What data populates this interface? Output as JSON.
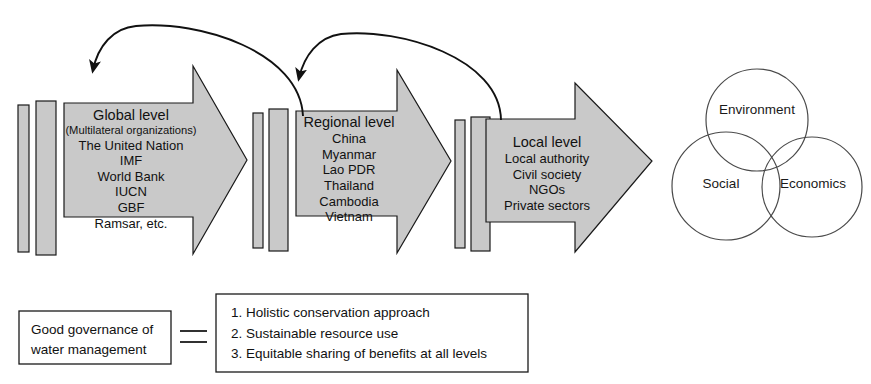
{
  "figure": {
    "type": "diagram"
  },
  "levels": [
    {
      "id": "global",
      "title": "Global level",
      "subtitle": "(Multilateral organizations)",
      "items": [
        "The United Nation",
        "IMF",
        "World Bank",
        "IUCN",
        "GBF",
        "Ramsar, etc."
      ]
    },
    {
      "id": "regional",
      "title": "Regional level",
      "subtitle": "",
      "items": [
        "China",
        "Myanmar",
        "Lao PDR",
        "Thailand",
        "Cambodia",
        "Vietnam"
      ]
    },
    {
      "id": "local",
      "title": "Local level",
      "subtitle": "",
      "items": [
        "Local authority",
        "Civil society",
        "NGOs",
        "Private sectors"
      ]
    }
  ],
  "feedback_arrows": [
    {
      "id": "regional-to-global",
      "from": "regional",
      "to": "global"
    },
    {
      "id": "local-to-regional",
      "from": "local",
      "to": "regional"
    }
  ],
  "venn": {
    "circles": [
      {
        "id": "environment",
        "label": "Environment"
      },
      {
        "id": "social",
        "label": "Social"
      },
      {
        "id": "economics",
        "label": "Economics"
      }
    ]
  },
  "governance": {
    "line1": "Good governance of",
    "line2": "water management",
    "connector": "equals"
  },
  "principles": [
    "1. Holistic conservation approach",
    "2. Sustainable resource use",
    "3. Equitable sharing of benefits at all levels"
  ],
  "colors": {
    "arrow_fill": "#c9c9c9",
    "outline": "#1a1a1a",
    "background": "#ffffff",
    "venn_stroke": "#4a4a4a"
  }
}
